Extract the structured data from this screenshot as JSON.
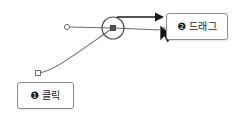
{
  "canvas": {
    "width": 233,
    "height": 118,
    "background": "#ffffff",
    "stroke_color": "#6e6e6e",
    "dark_color": "#1a1a1a",
    "border_color": "#8d8d8d"
  },
  "callouts": [
    {
      "id": "click",
      "badge": "❶",
      "text": "클릭",
      "x": 17,
      "y": 82,
      "width": 57,
      "height": 27
    },
    {
      "id": "drag",
      "badge": "❷",
      "text": "드래그",
      "x": 166,
      "y": 13,
      "width": 62,
      "height": 27
    }
  ],
  "diagram": {
    "type": "bezier-handle-editing",
    "anchor_point": {
      "x": 113,
      "y": 28,
      "radius": 11,
      "handle_size": 5
    },
    "left_handle_endpoint": {
      "x": 67,
      "y": 27,
      "radius": 2.6
    },
    "right_handle_endpoint": {
      "x": 163,
      "y": 30,
      "radius": 2.6
    },
    "curve_start_square": {
      "x": 38,
      "y": 73,
      "size": 5
    },
    "curve": "M 38 73 C 52 72 70 58 113 28",
    "tangent_line_left": {
      "x1": 67,
      "y1": 27,
      "x2": 113,
      "y2": 28
    },
    "tangent_line_right": {
      "x1": 113,
      "y1": 28,
      "x2": 163,
      "y2": 30
    },
    "drag_arrow": {
      "x1": 117,
      "y1": 17,
      "x2": 164,
      "y2": 17
    },
    "cursor": {
      "x": 160,
      "y": 29
    }
  }
}
